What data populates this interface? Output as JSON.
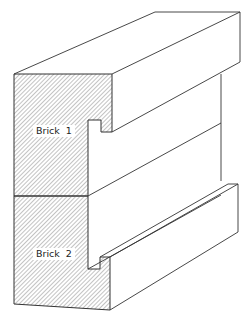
{
  "figure": {
    "type": "isometric brick cross-section illustration",
    "line_color": "#333333",
    "hatch_color": "#777777",
    "background": "#ffffff"
  },
  "labels": {
    "brick1": "Brick  1",
    "brick2": "Brick  2"
  }
}
